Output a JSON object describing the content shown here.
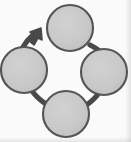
{
  "diagram": {
    "type": "cycle",
    "canvas": {
      "width": 131,
      "height": 142
    },
    "background_color": "#fbfbfb",
    "node_fill_color": "#c9c9c9",
    "node_stroke_color": "#555555",
    "connector_color": "#4a4a4a",
    "node_count": 4,
    "connector_count": 4,
    "arrowhead_count": 1,
    "direction": "clockwise",
    "nodes": [
      {
        "id": "node-top",
        "label": "",
        "cx": 70,
        "cy": 28,
        "r": 23
      },
      {
        "id": "node-right",
        "label": "",
        "cx": 104,
        "cy": 72,
        "r": 23
      },
      {
        "id": "node-bottom",
        "label": "",
        "cx": 66,
        "cy": 114,
        "r": 23
      },
      {
        "id": "node-left",
        "label": "",
        "cx": 24,
        "cy": 70,
        "r": 23
      }
    ],
    "connectors": [
      {
        "id": "connector-left-to-top",
        "from": "node-left",
        "to": "node-top",
        "has_arrowhead": true
      },
      {
        "id": "connector-top-to-right",
        "from": "node-top",
        "to": "node-right",
        "has_arrowhead": false
      },
      {
        "id": "connector-right-to-bottom",
        "from": "node-right",
        "to": "node-bottom",
        "has_arrowhead": false
      },
      {
        "id": "connector-bottom-to-left",
        "from": "node-bottom",
        "to": "node-left",
        "has_arrowhead": false
      }
    ],
    "arrowhead": {
      "id": "arrowhead-clockwise",
      "tip_x": 40,
      "tip_y": 30,
      "points_toward": "node-top"
    }
  }
}
